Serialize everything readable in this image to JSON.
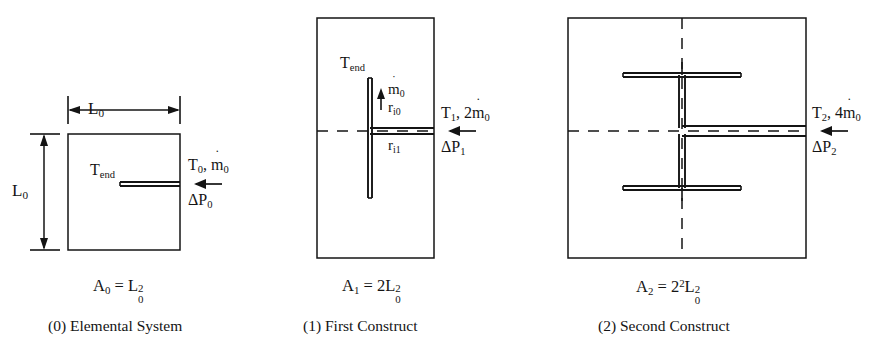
{
  "figure": {
    "type": "constructal-tree-diagram",
    "panel_count": 3,
    "ink_color": "#141414",
    "background": "#ffffff"
  },
  "panels": [
    {
      "id": "panel-0",
      "caption": "(0) Elemental System",
      "area_equation": {
        "lhs": "A",
        "lhs_sub": "0",
        "eq": "=",
        "base": "L",
        "base_sub": "0",
        "base_sup": "2",
        "coefficient": ""
      },
      "box": {
        "x": 68,
        "y": 134,
        "w": 112,
        "h": 116
      },
      "dim_horizontal_label": {
        "text": "L",
        "sub": "0"
      },
      "dim_vertical_label": {
        "text": "L",
        "sub": "0"
      },
      "labels": {
        "t_end": {
          "text": "T",
          "sub": "end"
        },
        "outlet_line1": {
          "t": "T",
          "t_sub": "0",
          "sep": ", ",
          "mdot": "m",
          "mdot_sub": "0",
          "coefficient": ""
        },
        "outlet_line2": {
          "text": "ΔP",
          "sub": "0"
        }
      }
    },
    {
      "id": "panel-1",
      "caption": "(1) First Construct",
      "area_equation": {
        "lhs": "A",
        "lhs_sub": "1",
        "eq": "=",
        "base": "L",
        "base_sub": "0",
        "base_sup": "2",
        "coefficient": "2"
      },
      "box": {
        "x": 317,
        "y": 18,
        "w": 117,
        "h": 240
      },
      "labels": {
        "t_end": {
          "text": "T",
          "sub": "end"
        },
        "mdot0": {
          "mdot": "m",
          "mdot_sub": "0"
        },
        "r_i0": {
          "text": "r",
          "sub": "i0"
        },
        "r_i1": {
          "text": "r",
          "sub": "i1"
        },
        "outlet_line1": {
          "t": "T",
          "t_sub": "1",
          "sep": ", ",
          "mdot": "m",
          "mdot_sub": "0",
          "coefficient": "2"
        },
        "outlet_line2": {
          "text": "ΔP",
          "sub": "1"
        }
      }
    },
    {
      "id": "panel-2",
      "caption": "(2) Second Construct",
      "area_equation": {
        "lhs": "A",
        "lhs_sub": "2",
        "eq": "=",
        "base": "L",
        "base_sub": "0",
        "base_sup": "2",
        "coefficient": "2",
        "coefficient_sup": "2"
      },
      "box": {
        "x": 568,
        "y": 18,
        "w": 238,
        "h": 240
      },
      "labels": {
        "outlet_line1": {
          "t": "T",
          "t_sub": "2",
          "sep": ", ",
          "mdot": "m",
          "mdot_sub": "0",
          "coefficient": "4"
        },
        "outlet_line2": {
          "text": "ΔP",
          "sub": "2"
        }
      }
    }
  ]
}
